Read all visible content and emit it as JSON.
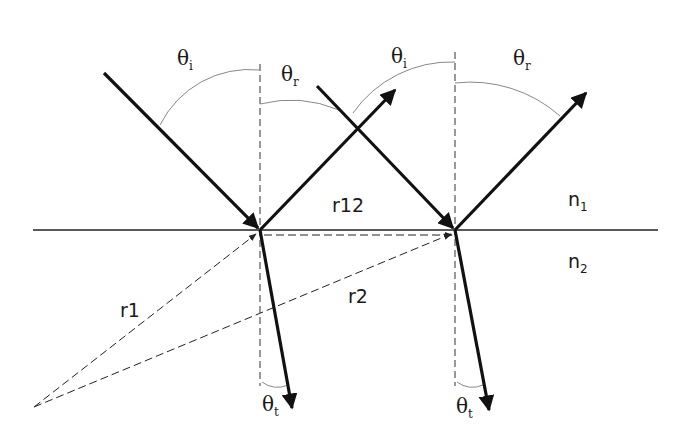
{
  "diagram": {
    "colors": {
      "ray": "#111111",
      "guide": "#333333",
      "arc": "#888888",
      "background": "#ffffff"
    },
    "media": [
      {
        "symbol": "n",
        "sub": "1",
        "region": "upper"
      },
      {
        "symbol": "n",
        "sub": "2",
        "region": "lower"
      }
    ],
    "vectors": [
      {
        "label": "r1",
        "from": "source",
        "to": "incidence-point-1"
      },
      {
        "label": "r2",
        "from": "source",
        "to": "incidence-point-2"
      },
      {
        "label": "r12",
        "from": "incidence-point-1",
        "to": "incidence-point-2"
      }
    ],
    "angles": {
      "left": [
        {
          "symbol": "θ",
          "sub": "i",
          "name": "incidence"
        },
        {
          "symbol": "θ",
          "sub": "r",
          "name": "reflection"
        },
        {
          "symbol": "θ",
          "sub": "t",
          "name": "transmission"
        }
      ],
      "right": [
        {
          "symbol": "θ",
          "sub": "i",
          "name": "incidence"
        },
        {
          "symbol": "θ",
          "sub": "r",
          "name": "reflection"
        },
        {
          "symbol": "θ",
          "sub": "t",
          "name": "transmission"
        }
      ]
    }
  }
}
